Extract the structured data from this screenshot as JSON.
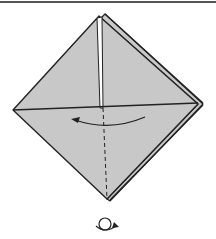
{
  "diagram": {
    "type": "origami-step",
    "colors": {
      "paper": "#c8c8c8",
      "line": "#222222",
      "background": "#ffffff",
      "rule": "#555555"
    },
    "elements": {
      "shape": "diamond (preliminary base, layered)",
      "crease_line": "horizontal center crease",
      "valley_fold": "vertical dashed valley fold line",
      "arrow": "curved arrow pointing left (fold right flap to left)",
      "symbol": "turn-over (flip model) symbol"
    }
  }
}
